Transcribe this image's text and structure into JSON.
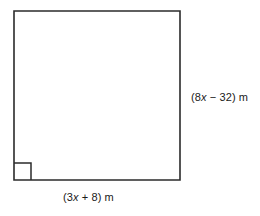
{
  "figure": {
    "kind": "geometry-diagram",
    "shape_name": "quadrilateral",
    "stroke_color": "#2b2b2b",
    "fill_color": "#ffffff",
    "background_color": "#ffffff",
    "stroke_width": 1.6,
    "vertices": [
      {
        "name": "top-left",
        "x": 14,
        "y": 11
      },
      {
        "name": "top-right",
        "x": 180,
        "y": 11
      },
      {
        "name": "bottom-right",
        "x": 180,
        "y": 180
      },
      {
        "name": "bottom-left",
        "x": 14,
        "y": 180
      }
    ],
    "right_angle_mark": {
      "at_vertex": "bottom-left",
      "size": 17,
      "x": 14,
      "y": 163
    }
  },
  "labels": {
    "right_side": {
      "full_text": "(8x − 32) m",
      "open_paren": "(",
      "coefficient": "8",
      "variable": "x",
      "operator": "−",
      "constant": "32",
      "close_paren": ")",
      "unit": "m"
    },
    "bottom_side": {
      "full_text": "(3x + 8) m",
      "open_paren": "(",
      "coefficient": "3",
      "variable": "x",
      "operator": "+",
      "constant": "8",
      "close_paren": ")",
      "unit": "m"
    }
  }
}
